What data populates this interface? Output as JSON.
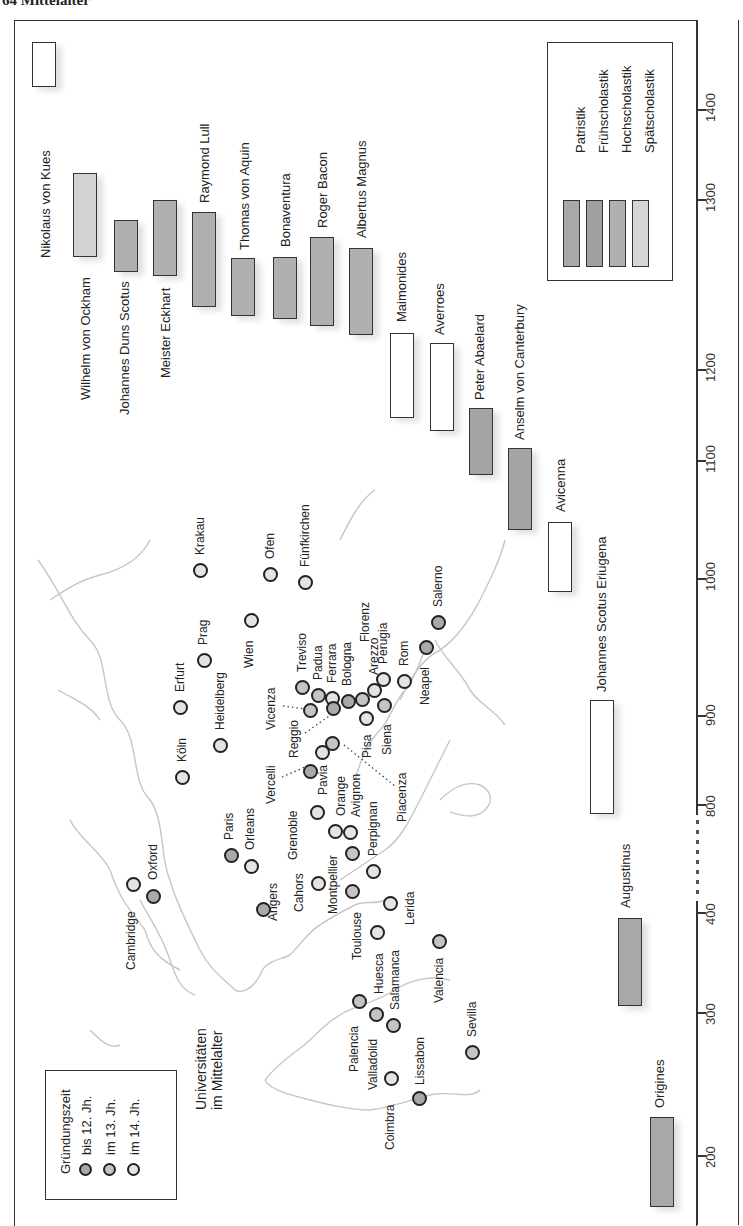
{
  "page_header": "64 Mittelalter",
  "colors": {
    "patristik": "#a8a8a8",
    "fruehscholastik": "#a4a4a4",
    "hochscholastik": "#b0b0b0",
    "spaetscholastik": "#d2d2d2",
    "non_christian": "#ffffff",
    "city_12": "#a9a9a9",
    "city_13": "#c4c4c4",
    "city_14": "#e4e4e4",
    "coast": "#c6c6c6"
  },
  "timeline": {
    "axis_ticks": [
      "1400",
      "1300",
      "1200",
      "1100",
      "1000",
      "900",
      "800",
      "400",
      "300",
      "200"
    ],
    "legend": {
      "items": [
        "Patristik",
        "Frühscholastik",
        "Hochscholastik",
        "Spätscholastik"
      ]
    },
    "philosophers": [
      {
        "name": "Nikolaus von Kues",
        "period": "Spätscholastik"
      },
      {
        "name": "Wilhelm von Ockham",
        "period": "Spätscholastik"
      },
      {
        "name": "Johannes Duns Scotus",
        "period": "Hochscholastik"
      },
      {
        "name": "Meister Eckhart",
        "period": "Hochscholastik"
      },
      {
        "name": "Raymond Lull",
        "period": "Hochscholastik"
      },
      {
        "name": "Thomas von Aquin",
        "period": "Hochscholastik"
      },
      {
        "name": "Bonaventura",
        "period": "Hochscholastik"
      },
      {
        "name": "Roger Bacon",
        "period": "Hochscholastik"
      },
      {
        "name": "Albertus Magnus",
        "period": "Hochscholastik"
      },
      {
        "name": "Maimonides",
        "period": "none"
      },
      {
        "name": "Averroes",
        "period": "none"
      },
      {
        "name": "Peter Abaelard",
        "period": "Frühscholastik"
      },
      {
        "name": "Anselm von Canterbury",
        "period": "Frühscholastik"
      },
      {
        "name": "Avicenna",
        "period": "none"
      },
      {
        "name": "Johannes Scotus Eriugena",
        "period": "none"
      },
      {
        "name": "Augustinus",
        "period": "Patristik"
      },
      {
        "name": "Origines",
        "period": "Patristik"
      }
    ]
  },
  "map": {
    "title_line1": "Universitäten",
    "title_line2": "im Mittelalter",
    "legend": {
      "title": "Gründungszeit",
      "items": [
        "bis 12. Jh.",
        "im 13. Jh.",
        "im 14. Jh."
      ]
    },
    "cities": [
      "Krakau",
      "Ofen",
      "Fünfkirchen",
      "Prag",
      "Wien",
      "Erfurt",
      "Heidelberg",
      "Köln",
      "Treviso",
      "Padua",
      "Ferrara",
      "Bologna",
      "Florenz",
      "Arezzo",
      "Perugia",
      "Rom",
      "Neapel",
      "Salerno",
      "Vicenza",
      "Reggio",
      "Vercelli",
      "Pavia",
      "Grenoble",
      "Orange",
      "Avignon",
      "Pisa",
      "Siena",
      "Piacenza",
      "Paris",
      "Orleans",
      "Cambridge",
      "Oxford",
      "Angers",
      "Cahors",
      "Montpellier",
      "Perpignan",
      "Toulouse",
      "Lerida",
      "Huesca",
      "Salamanca",
      "Valencia",
      "Palencia",
      "Valladolid",
      "Coimbra",
      "Lissabon",
      "Sevilla"
    ]
  }
}
